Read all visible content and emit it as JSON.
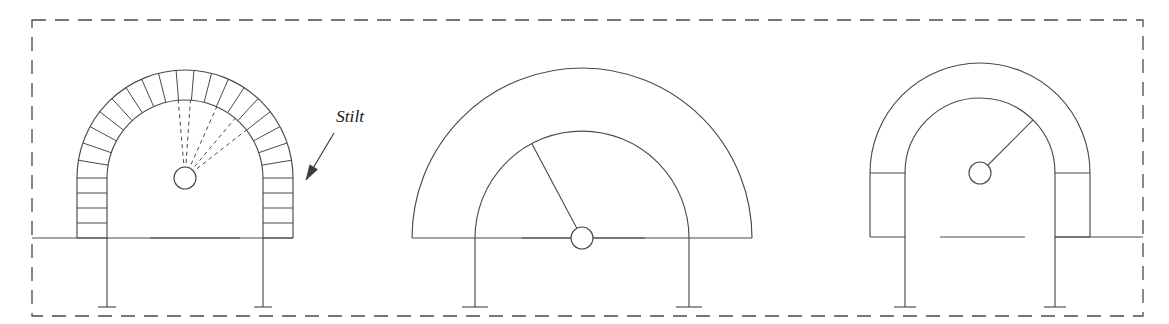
{
  "figure": {
    "background_color": "#ffffff",
    "line_color": "#4a4a4a",
    "width": 1169,
    "height": 324,
    "annotations": [
      {
        "id": "stilt-label",
        "text": "Stilt",
        "x": 336,
        "y": 122,
        "style": "italic-serif",
        "leader_from": [
          334,
          133
        ],
        "leader_to": [
          306,
          180
        ]
      }
    ],
    "frame": {
      "name": "dashed-boundary",
      "style": "dashed",
      "x": 32,
      "y": 20,
      "width": 1111,
      "height": 296,
      "dash_pattern": "14 9"
    },
    "arches": [
      {
        "id": "arch-1",
        "name": "stilted-arch-with-voussoirs",
        "label": "Stilted arch with voussoirs",
        "center_x": 185,
        "center_y": 178,
        "inner_radius": 78,
        "outer_radius": 108,
        "springing_y": 178,
        "base_y": 238,
        "voussoir_count": 19,
        "stilt_courses": 4,
        "has_voussoirs": true,
        "has_dashed_radii": true,
        "dashed_radii_count": 5,
        "center_marker_radius": 11,
        "pier_left_x": 77,
        "pier_right_x": 293,
        "leg_bottom_y": 307,
        "leg_foot_half_width": 9,
        "ground_line": {
          "x1": 150,
          "x2": 240,
          "y": 238
        },
        "springing_line": {
          "x1": 32,
          "x2": 293,
          "y": 238
        }
      },
      {
        "id": "arch-2",
        "name": "semicircular-arch",
        "label": "Semicircular arch",
        "center_x": 582,
        "center_y": 238,
        "inner_radius": 107,
        "outer_radius": 170,
        "springing_y": 238,
        "base_y": 238,
        "voussoir_count": 0,
        "stilt_courses": 0,
        "has_voussoirs": false,
        "has_dashed_radii": false,
        "radius_line_angle_deg": 118,
        "center_marker_radius": 11,
        "pier_left_x": 475,
        "pier_right_x": 689,
        "leg_bottom_y": 307,
        "leg_foot_half_width": 13,
        "ground_line": {
          "x1": 522,
          "x2": 645,
          "y": 238
        },
        "springing_line": {
          "x1": 412,
          "x2": 752,
          "y": 238
        }
      },
      {
        "id": "arch-3",
        "name": "stilted-arch-plain",
        "label": "Stilted arch (plain)",
        "center_x": 980,
        "center_y": 173,
        "inner_radius": 75,
        "outer_radius": 110,
        "springing_y": 173,
        "base_y": 237,
        "voussoir_count": 0,
        "stilt_courses": 1,
        "has_voussoirs": false,
        "has_dashed_radii": false,
        "radius_line_angle_deg": 45,
        "center_marker_radius": 11,
        "pier_left_x": 870,
        "pier_right_x": 1090,
        "leg_bottom_y": 307,
        "leg_foot_half_width": 11,
        "ground_line": {
          "x1": 940,
          "x2": 1025,
          "y": 237
        },
        "springing_line": {
          "x1": 1055,
          "x2": 1143,
          "y": 237
        }
      }
    ]
  }
}
